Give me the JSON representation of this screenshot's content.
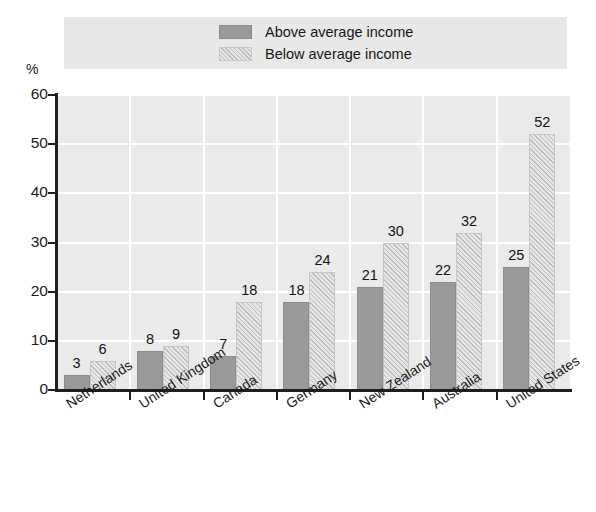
{
  "chart_data": {
    "type": "bar",
    "title": "",
    "xlabel": "",
    "ylabel": "%",
    "ylim": [
      0,
      60
    ],
    "yticks": [
      0,
      10,
      20,
      30,
      40,
      50,
      60
    ],
    "grid": "both-white-on-gray",
    "legend_position": "top",
    "categories": [
      "Netherlands",
      "United Kingdom",
      "Canada",
      "Germany",
      "New Zealand",
      "Australia",
      "United States"
    ],
    "series": [
      {
        "name": "Above average income",
        "fill": "solid",
        "color": "#9a9a9a",
        "values": [
          3,
          8,
          7,
          18,
          21,
          22,
          25
        ]
      },
      {
        "name": "Below average income",
        "fill": "diagonal-hatch",
        "color": "#e6e6e6",
        "values": [
          6,
          9,
          18,
          24,
          30,
          32,
          52
        ]
      }
    ]
  },
  "legend": {
    "items": [
      {
        "label": "Above average income",
        "swatch": "solid-gray-swatch"
      },
      {
        "label": "Below average income",
        "swatch": "hatched-gray-swatch"
      }
    ]
  },
  "axes": {
    "y_unit": "%",
    "y_tick_labels": [
      "60",
      "50",
      "40",
      "30",
      "20",
      "10",
      "0"
    ]
  }
}
